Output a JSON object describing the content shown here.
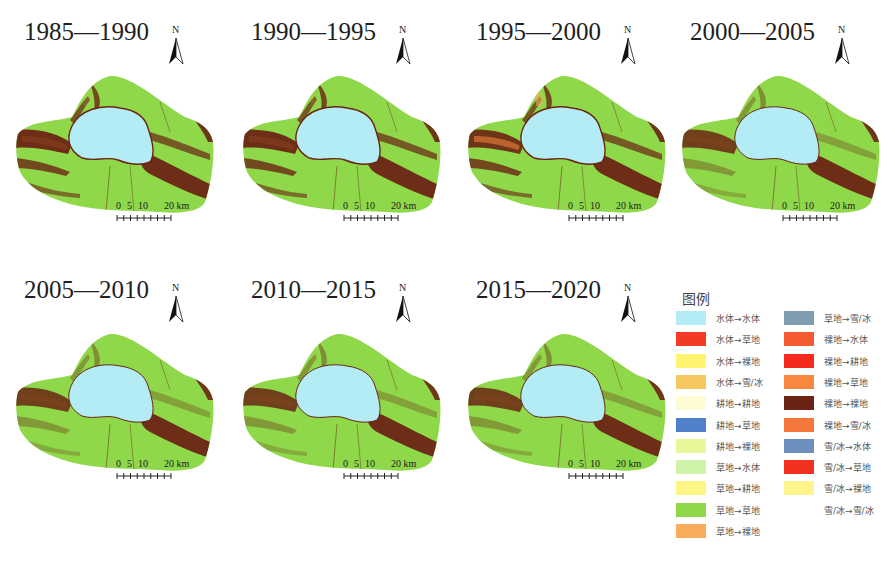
{
  "panels": [
    {
      "title": "1985—1990",
      "variant": 0
    },
    {
      "title": "1990—1995",
      "variant": 0
    },
    {
      "title": "1995—2000",
      "variant": 1
    },
    {
      "title": "2000—2005",
      "variant": 2
    },
    {
      "title": "2005—2010",
      "variant": 2
    },
    {
      "title": "2010—2015",
      "variant": 3
    },
    {
      "title": "2015—2020",
      "variant": 3
    }
  ],
  "north_label": "N",
  "scale_bar": {
    "labels": [
      "0",
      "5",
      "10",
      "20 km"
    ]
  },
  "legend": {
    "title": "图例",
    "items": [
      {
        "label": "水体→水体",
        "color": "#b3ecf5"
      },
      {
        "label": "水体→草地",
        "color": "#f23a25"
      },
      {
        "label": "水体→裸地",
        "color": "#fff372"
      },
      {
        "label": "水体→雪/冰",
        "color": "#f8c860"
      },
      {
        "label": "耕地→耕地",
        "color": "#fdfbd2"
      },
      {
        "label": "耕地→草地",
        "color": "#4f80c8"
      },
      {
        "label": "耕地→裸地",
        "color": "#e8f79a"
      },
      {
        "label": "草地→水体",
        "color": "#cdf2a8"
      },
      {
        "label": "草地→耕地",
        "color": "#fdf685"
      },
      {
        "label": "草地→草地",
        "color": "#8ed84a"
      },
      {
        "label": "草地→裸地",
        "color": "#f9ac5c"
      },
      {
        "label": "草地→雪/冰",
        "color": "#7f9db1"
      },
      {
        "label": "裸地→水体",
        "color": "#f45a30"
      },
      {
        "label": "裸地→耕地",
        "color": "#f42a1c"
      },
      {
        "label": "裸地→草地",
        "color": "#f8883e"
      },
      {
        "label": "裸地→裸地",
        "color": "#6b2414"
      },
      {
        "label": "裸地→雪/冰",
        "color": "#f5783a"
      },
      {
        "label": "雪/冰→水体",
        "color": "#6c8fbd"
      },
      {
        "label": "雪/冰→草地",
        "color": "#f0321f"
      },
      {
        "label": "雪/冰→裸地",
        "color": "#fdf58c"
      },
      {
        "label": "雪/冰→雪/冰",
        "color": "#ffffff"
      }
    ]
  },
  "colors": {
    "grass": "#8ed84a",
    "water": "#b3ecf5",
    "bare": "#6b2414",
    "bare_to_grass": "#f8883e",
    "grass_to_bare": "#f9ac5c"
  }
}
